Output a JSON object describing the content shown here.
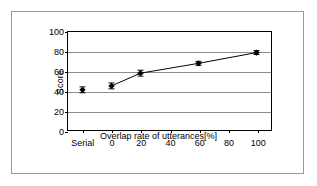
{
  "chart_data": {
    "type": "line",
    "title": "",
    "xlabel": "Overlap rate of utterances[%]",
    "ylabel": "Score",
    "categories": [
      "Serial",
      "0",
      "20",
      "60",
      "100"
    ],
    "x": [
      -20,
      0,
      20,
      60,
      100
    ],
    "values": [
      41,
      45,
      58,
      68,
      79
    ],
    "error_low": [
      3,
      3,
      3,
      2,
      2
    ],
    "error_high": [
      3,
      3,
      3,
      2,
      2
    ],
    "series": [
      {
        "name": "Score",
        "values": [
          41,
          45,
          58,
          68,
          79
        ],
        "marker": "diamond",
        "color": "#000000"
      }
    ],
    "connected_from_index": 1,
    "xlim": [
      -30,
      110
    ],
    "ylim": [
      0,
      100
    ],
    "y_ticks": [
      0,
      20,
      40,
      60,
      80,
      100
    ],
    "x_ticks": [
      -20,
      0,
      20,
      40,
      60,
      80,
      100
    ],
    "x_tick_labels": [
      "Serial",
      "0",
      "20",
      "40",
      "60",
      "80",
      "100"
    ],
    "grid": "horizontal",
    "legend": "none"
  },
  "axes": {
    "y_title": "Score",
    "x_title": "Overlap rate of utterances[%]",
    "y_tick_labels": [
      "100",
      "80",
      "60",
      "40",
      "20",
      "0"
    ],
    "x_tick_labels": [
      "Serial",
      "0",
      "20",
      "40",
      "60",
      "80",
      "100"
    ]
  },
  "colors": {
    "marker": "#000000",
    "line": "#000000",
    "gridline": "#8d8d8d",
    "frame": "#000000",
    "outer_frame": "#9a9a9a",
    "background": "#ffffff"
  }
}
